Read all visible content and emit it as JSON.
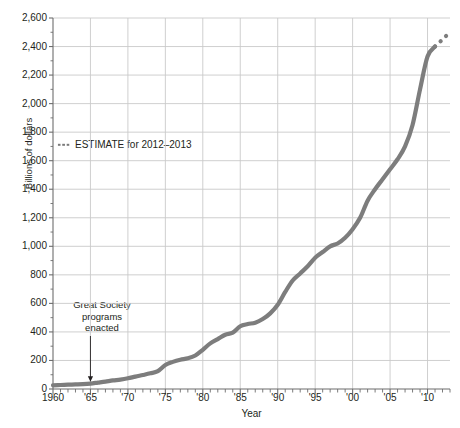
{
  "chart_data": {
    "type": "line",
    "title": "",
    "xlabel": "Year",
    "ylabel": "Billions of dollars",
    "xlim": [
      1960,
      2013
    ],
    "ylim": [
      0,
      2600
    ],
    "y_ticks": [
      0,
      200,
      400,
      600,
      800,
      1000,
      1200,
      1400,
      1600,
      1800,
      2000,
      2200,
      2400,
      2600
    ],
    "y_ticklabels": [
      "0",
      "200",
      "400",
      "600",
      "800",
      "1,000",
      "1,200",
      "1,400",
      "1,600",
      "1,800",
      "2,000",
      "2,200",
      "2,400",
      "2,600"
    ],
    "x_ticks": [
      1960,
      1965,
      1970,
      1975,
      1980,
      1985,
      1990,
      1995,
      2000,
      2005,
      2010
    ],
    "x_ticklabels": [
      "1960",
      "'65",
      "'70",
      "'75",
      "'80",
      "'85",
      "'90",
      "'95",
      "'00",
      "'05",
      "'10"
    ],
    "x_minor_tick_interval": 1,
    "grid": true,
    "legend_position": "upper-left-inside",
    "series": [
      {
        "name": "Actual",
        "style": "solid",
        "color": "#7d7d7d",
        "x": [
          1960,
          1961,
          1962,
          1963,
          1964,
          1965,
          1966,
          1967,
          1968,
          1969,
          1970,
          1971,
          1972,
          1973,
          1974,
          1975,
          1976,
          1977,
          1978,
          1979,
          1980,
          1981,
          1982,
          1983,
          1984,
          1985,
          1986,
          1987,
          1988,
          1989,
          1990,
          1991,
          1992,
          1993,
          1994,
          1995,
          1996,
          1997,
          1998,
          1999,
          2000,
          2001,
          2002,
          2003,
          2004,
          2005,
          2006,
          2007,
          2008,
          2009,
          2010,
          2011
        ],
        "values": [
          26,
          28,
          30,
          32,
          34,
          38,
          45,
          52,
          60,
          66,
          75,
          87,
          98,
          110,
          125,
          168,
          190,
          205,
          215,
          235,
          275,
          320,
          350,
          380,
          395,
          440,
          455,
          465,
          490,
          530,
          590,
          680,
          760,
          810,
          860,
          920,
          960,
          1000,
          1020,
          1060,
          1120,
          1200,
          1320,
          1400,
          1470,
          1540,
          1610,
          1700,
          1850,
          2100,
          2330,
          2400
        ]
      },
      {
        "name": "ESTIMATE for 2012-2013",
        "style": "dotted",
        "color": "#7d7d7d",
        "x": [
          2011,
          2012,
          2013
        ],
        "values": [
          2400,
          2450,
          2500
        ]
      }
    ],
    "legend": [
      {
        "label": "ESTIMATE for 2012–2013",
        "style": "dotted",
        "color": "#7d7d7d"
      }
    ],
    "annotations": [
      {
        "name": "great-society-annotation",
        "lines": [
          "Great Society",
          "programs",
          "enacted"
        ],
        "point_x": 1965,
        "point_y": 40,
        "arrow": "down"
      }
    ]
  },
  "colors": {
    "line": "#7d7d7d",
    "grid": "#c9c9c9",
    "axis": "#6d6d6d",
    "text": "#231f20"
  }
}
